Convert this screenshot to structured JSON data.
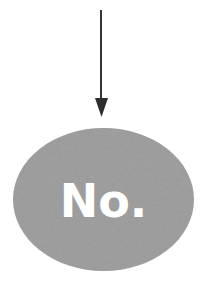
{
  "diagram": {
    "type": "flowchart-fragment",
    "arrow": {
      "direction": "down",
      "color": "#333333",
      "x": 101,
      "y_start": 10,
      "y_end": 117
    },
    "node": {
      "shape": "ellipse",
      "label": "No.",
      "fill": "#a6a6a6",
      "text_color": "#ffffff",
      "cx": 103.5,
      "cy": 199.5,
      "rx": 90.5,
      "ry": 71.5
    }
  }
}
